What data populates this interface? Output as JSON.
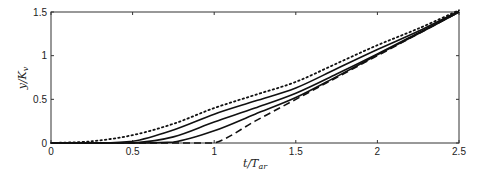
{
  "chart_data": {
    "type": "line",
    "title": "",
    "xlabel": "t/T_ar",
    "xlabel_main": "t/T",
    "xlabel_sub": "ar",
    "ylabel": "y/K_v",
    "ylabel_main": "y/K",
    "ylabel_sub": "v",
    "xlim": [
      0,
      2.5
    ],
    "ylim": [
      0,
      1.5
    ],
    "xticks": [
      0,
      0.5,
      1,
      1.5,
      2,
      2.5
    ],
    "xtick_labels": [
      "0",
      "0.5",
      "1",
      "1.5",
      "2",
      "2.5"
    ],
    "yticks": [
      0,
      0.5,
      1,
      1.5
    ],
    "ytick_labels": [
      "0",
      "0.5",
      "1",
      "1.5"
    ],
    "grid": false,
    "legend": null,
    "x": [
      0,
      0.25,
      0.5,
      0.75,
      1.0,
      1.25,
      1.5,
      1.75,
      2.0,
      2.25,
      2.5
    ],
    "series": [
      {
        "name": "dotted",
        "style": "dotted",
        "values": [
          0,
          0.02,
          0.09,
          0.22,
          0.4,
          0.55,
          0.7,
          0.91,
          1.12,
          1.31,
          1.52
        ]
      },
      {
        "name": "solid-1",
        "style": "solid",
        "values": [
          0,
          0,
          0.02,
          0.15,
          0.33,
          0.48,
          0.63,
          0.85,
          1.07,
          1.28,
          1.51
        ]
      },
      {
        "name": "solid-2",
        "style": "solid",
        "values": [
          0,
          0,
          0,
          0.07,
          0.24,
          0.4,
          0.57,
          0.79,
          1.02,
          1.26,
          1.5
        ]
      },
      {
        "name": "solid-3",
        "style": "solid",
        "values": [
          0,
          0,
          0,
          0.01,
          0.14,
          0.33,
          0.52,
          0.76,
          1.01,
          1.25,
          1.5
        ]
      },
      {
        "name": "dashed",
        "style": "dashed",
        "values": [
          0,
          0,
          0,
          0,
          0,
          0.25,
          0.5,
          0.75,
          1.0,
          1.25,
          1.5
        ]
      }
    ]
  }
}
